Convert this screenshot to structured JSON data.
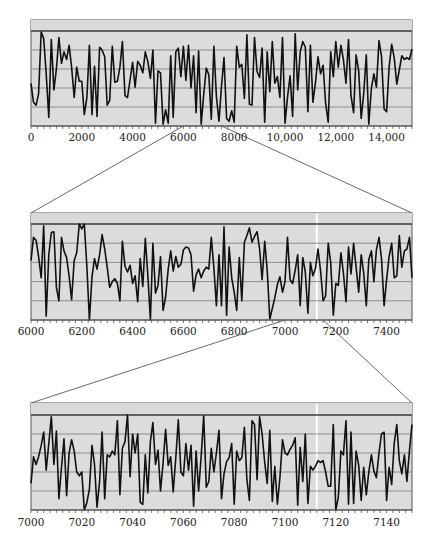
{
  "figure": {
    "colors": {
      "panel_fill": "#dcdcdc",
      "top_band_fill": "#d9d9d9",
      "frame": "#555555",
      "top_line": "#3a3a3a",
      "gridline": "#8c8c8c",
      "series": "#111111",
      "connector": "#444444",
      "highlight_stripe": "#ffffff",
      "tick_label": "#222222"
    }
  },
  "chart_data": [
    {
      "type": "line",
      "title": "",
      "xlabel": "",
      "ylabel": "",
      "xlim": [
        0,
        15000
      ],
      "ylim": [
        0,
        1
      ],
      "grid": "horizontal",
      "legend": "none",
      "tick_labels": [
        "0",
        "2000",
        "4000",
        "6000",
        "8000",
        "10,000",
        "12,000",
        "14,000"
      ],
      "tick_values": [
        0,
        2000,
        4000,
        6000,
        8000,
        10000,
        12000,
        14000
      ],
      "minor_tick_step": 250,
      "zoom_range": [
        6000,
        7500
      ],
      "x": [
        0,
        100,
        200,
        300,
        400,
        500,
        600,
        700,
        800,
        900,
        1000,
        1100,
        1200,
        1300,
        1400,
        1500,
        1600,
        1700,
        1800,
        1900,
        2000,
        2100,
        2200,
        2300,
        2400,
        2500,
        2600,
        2700,
        2800,
        2900,
        3000,
        3100,
        3200,
        3300,
        3400,
        3500,
        3600,
        3700,
        3800,
        3900,
        4000,
        4100,
        4200,
        4300,
        4400,
        4500,
        4600,
        4700,
        4800,
        4900,
        5000,
        5100,
        5200,
        5300,
        5400,
        5500,
        5600,
        5700,
        5800,
        5900,
        6000,
        6100,
        6200,
        6300,
        6400,
        6500,
        6600,
        6700,
        6800,
        6900,
        7000,
        7100,
        7200,
        7300,
        7400,
        7500,
        7600,
        7700,
        7800,
        7900,
        8000,
        8100,
        8200,
        8300,
        8400,
        8500,
        8600,
        8700,
        8800,
        8900,
        9000,
        9100,
        9200,
        9300,
        9400,
        9500,
        9600,
        9700,
        9800,
        9900,
        10000,
        10100,
        10200,
        10300,
        10400,
        10500,
        10600,
        10700,
        10800,
        10900,
        11000,
        11100,
        11200,
        11300,
        11400,
        11500,
        11600,
        11700,
        11800,
        11900,
        12000,
        12100,
        12200,
        12300,
        12400,
        12500,
        12600,
        12700,
        12800,
        12900,
        13000,
        13100,
        13200,
        13300,
        13400,
        13500,
        13600,
        13700,
        13800,
        13900,
        14000,
        14100,
        14200,
        14300,
        14400,
        14500,
        14600,
        14700,
        14800,
        14900,
        15000
      ],
      "values": [
        0.45,
        0.25,
        0.22,
        0.34,
        0.99,
        0.92,
        0.55,
        0.09,
        0.91,
        0.38,
        0.6,
        0.93,
        0.66,
        0.78,
        0.7,
        0.85,
        0.62,
        0.3,
        0.62,
        0.47,
        0.47,
        0.12,
        0.3,
        0.85,
        0.12,
        0.63,
        0.1,
        0.83,
        0.8,
        0.73,
        0.22,
        0.27,
        0.84,
        0.46,
        0.47,
        0.62,
        0.89,
        0.32,
        0.3,
        0.49,
        0.67,
        0.41,
        0.68,
        0.64,
        0.56,
        0.78,
        0.68,
        0.5,
        0.8,
        0.03,
        0.58,
        0.56,
        0.02,
        0.17,
        0.03,
        0.74,
        0.09,
        0.78,
        0.82,
        0.52,
        0.84,
        0.48,
        0.85,
        0.4,
        0.74,
        0.14,
        0.79,
        0.02,
        0.33,
        0.61,
        0.54,
        0.07,
        0.84,
        0.31,
        0.05,
        0.42,
        0.72,
        0.08,
        0.05,
        0.16,
        0.04,
        0.84,
        0.62,
        0.65,
        0.29,
        0.96,
        0.23,
        0.22,
        0.93,
        0.57,
        0.51,
        0.82,
        0.04,
        0.78,
        0.36,
        0.89,
        0.45,
        0.52,
        0.3,
        0.93,
        0.03,
        0.3,
        0.53,
        0.1,
        0.97,
        0.38,
        0.78,
        0.89,
        0.83,
        0.15,
        0.85,
        0.25,
        0.46,
        0.73,
        0.55,
        0.64,
        0.24,
        0.04,
        0.78,
        0.52,
        0.89,
        0.62,
        0.85,
        0.7,
        0.45,
        0.91,
        0.32,
        0.14,
        0.75,
        0.58,
        0.08,
        0.34,
        0.75,
        0.02,
        0.4,
        0.55,
        0.41,
        0.9,
        0.73,
        0.18,
        0.15,
        0.62,
        0.86,
        0.72,
        0.44,
        0.59,
        0.74,
        0.7,
        0.72,
        0.7,
        0.81
      ]
    },
    {
      "type": "line",
      "title": "",
      "xlabel": "",
      "ylabel": "",
      "xlim": [
        6000,
        7500
      ],
      "ylim": [
        0,
        1
      ],
      "grid": "horizontal",
      "legend": "none",
      "tick_labels": [
        "6000",
        "6200",
        "6400",
        "6600",
        "6800",
        "7000",
        "7200",
        "7400"
      ],
      "tick_values": [
        6000,
        6200,
        6400,
        6600,
        6800,
        7000,
        7200,
        7400
      ],
      "minor_tick_step": 25,
      "zoom_range": [
        7000,
        7150
      ],
      "highlight_x": 7125,
      "x": [
        6000,
        6010,
        6020,
        6030,
        6040,
        6050,
        6060,
        6070,
        6080,
        6090,
        6100,
        6110,
        6120,
        6130,
        6140,
        6150,
        6160,
        6170,
        6180,
        6190,
        6200,
        6210,
        6220,
        6230,
        6240,
        6250,
        6260,
        6270,
        6280,
        6290,
        6300,
        6310,
        6320,
        6330,
        6340,
        6350,
        6360,
        6370,
        6380,
        6390,
        6400,
        6410,
        6420,
        6430,
        6440,
        6450,
        6460,
        6470,
        6480,
        6490,
        6500,
        6510,
        6520,
        6530,
        6540,
        6550,
        6560,
        6570,
        6580,
        6590,
        6600,
        6610,
        6620,
        6630,
        6640,
        6650,
        6660,
        6670,
        6680,
        6690,
        6700,
        6710,
        6720,
        6730,
        6740,
        6750,
        6760,
        6770,
        6780,
        6790,
        6800,
        6810,
        6820,
        6830,
        6840,
        6850,
        6860,
        6870,
        6880,
        6890,
        6900,
        6910,
        6920,
        6930,
        6940,
        6950,
        6960,
        6970,
        6980,
        6990,
        7000,
        7010,
        7020,
        7030,
        7040,
        7050,
        7060,
        7070,
        7080,
        7090,
        7100,
        7110,
        7120,
        7130,
        7140,
        7150,
        7160,
        7170,
        7180,
        7190,
        7200,
        7210,
        7220,
        7230,
        7240,
        7250,
        7260,
        7270,
        7280,
        7290,
        7300,
        7310,
        7320,
        7330,
        7340,
        7350,
        7360,
        7370,
        7380,
        7390,
        7400,
        7410,
        7420,
        7430,
        7440,
        7450,
        7460,
        7470,
        7480,
        7490,
        7500
      ],
      "values": [
        0.62,
        0.86,
        0.83,
        0.66,
        0.44,
        0.98,
        0.04,
        0.68,
        0.91,
        0.92,
        0.34,
        0.2,
        0.86,
        0.72,
        0.65,
        0.46,
        0.21,
        0.62,
        0.7,
        1.0,
        0.95,
        1.0,
        0.55,
        0.0,
        0.45,
        0.64,
        0.53,
        0.68,
        0.89,
        0.74,
        0.55,
        0.34,
        0.4,
        0.43,
        0.38,
        0.2,
        0.82,
        0.56,
        0.5,
        0.57,
        0.38,
        0.46,
        0.19,
        0.64,
        0.35,
        0.85,
        0.47,
        0.0,
        0.8,
        0.28,
        0.36,
        0.66,
        0.1,
        0.24,
        0.53,
        0.72,
        0.51,
        0.66,
        0.55,
        0.58,
        0.73,
        0.76,
        0.75,
        0.68,
        0.3,
        0.47,
        0.53,
        0.44,
        0.51,
        0.55,
        0.53,
        0.86,
        0.54,
        0.15,
        0.68,
        0.15,
        0.97,
        0.05,
        0.76,
        0.44,
        0.29,
        0.1,
        0.65,
        0.2,
        0.81,
        0.88,
        0.96,
        0.81,
        0.87,
        0.92,
        0.74,
        0.42,
        0.82,
        0.52,
        0.01,
        0.12,
        0.23,
        0.37,
        0.45,
        0.29,
        0.4,
        0.86,
        0.42,
        0.38,
        0.52,
        0.68,
        0.15,
        0.65,
        0.5,
        0.07,
        0.6,
        0.46,
        0.54,
        0.74,
        0.51,
        0.2,
        0.25,
        0.8,
        0.6,
        0.05,
        0.38,
        0.36,
        0.7,
        0.49,
        0.19,
        0.76,
        0.48,
        0.8,
        0.55,
        0.29,
        0.68,
        0.49,
        0.15,
        0.63,
        0.72,
        0.4,
        0.73,
        0.86,
        0.64,
        0.15,
        0.42,
        0.66,
        0.8,
        0.44,
        0.46,
        0.88,
        0.55,
        0.72,
        0.74,
        0.86,
        0.44
      ]
    },
    {
      "type": "line",
      "title": "",
      "xlabel": "",
      "ylabel": "",
      "xlim": [
        7000,
        7150
      ],
      "ylim": [
        0,
        1
      ],
      "grid": "horizontal",
      "legend": "none",
      "tick_labels": [
        "7000",
        "7020",
        "7040",
        "7060",
        "7080",
        "7100",
        "7120",
        "7140"
      ],
      "tick_values": [
        7000,
        7020,
        7040,
        7060,
        7080,
        7100,
        7120,
        7140
      ],
      "minor_tick_step": 2.5,
      "highlight_x": 7112.5,
      "x": [
        7000,
        7001,
        7002,
        7003,
        7004,
        7005,
        7006,
        7007,
        7008,
        7009,
        7010,
        7011,
        7012,
        7013,
        7014,
        7015,
        7016,
        7017,
        7018,
        7019,
        7020,
        7021,
        7022,
        7023,
        7024,
        7025,
        7026,
        7027,
        7028,
        7029,
        7030,
        7031,
        7032,
        7033,
        7034,
        7035,
        7036,
        7037,
        7038,
        7039,
        7040,
        7041,
        7042,
        7043,
        7044,
        7045,
        7046,
        7047,
        7048,
        7049,
        7050,
        7051,
        7052,
        7053,
        7054,
        7055,
        7056,
        7057,
        7058,
        7059,
        7060,
        7061,
        7062,
        7063,
        7064,
        7065,
        7066,
        7067,
        7068,
        7069,
        7070,
        7071,
        7072,
        7073,
        7074,
        7075,
        7076,
        7077,
        7078,
        7079,
        7080,
        7081,
        7082,
        7083,
        7084,
        7085,
        7086,
        7087,
        7088,
        7089,
        7090,
        7091,
        7092,
        7093,
        7094,
        7095,
        7096,
        7097,
        7098,
        7099,
        7100,
        7101,
        7102,
        7103,
        7104,
        7105,
        7106,
        7107,
        7108,
        7109,
        7110,
        7111,
        7112,
        7113,
        7114,
        7115,
        7116,
        7117,
        7118,
        7119,
        7120,
        7121,
        7122,
        7123,
        7124,
        7125,
        7126,
        7127,
        7128,
        7129,
        7130,
        7131,
        7132,
        7133,
        7134,
        7135,
        7136,
        7137,
        7138,
        7139,
        7140,
        7141,
        7142,
        7143,
        7144,
        7145,
        7146,
        7147,
        7148,
        7149,
        7150
      ],
      "values": [
        0.28,
        0.56,
        0.48,
        0.56,
        0.68,
        0.82,
        0.42,
        0.7,
        0.98,
        0.48,
        0.83,
        0.12,
        0.45,
        0.75,
        0.15,
        0.6,
        0.74,
        0.62,
        0.4,
        0.36,
        0.4,
        0.0,
        0.08,
        0.22,
        0.68,
        0.48,
        0.03,
        0.3,
        0.82,
        0.12,
        0.58,
        0.56,
        0.62,
        0.58,
        0.94,
        0.16,
        0.65,
        0.72,
        1.0,
        0.35,
        0.8,
        0.6,
        0.8,
        0.08,
        0.06,
        0.58,
        0.18,
        0.72,
        0.92,
        0.48,
        0.63,
        0.2,
        0.5,
        0.85,
        0.47,
        0.56,
        0.19,
        0.55,
        0.95,
        0.4,
        0.36,
        0.7,
        0.42,
        0.68,
        0.04,
        0.62,
        0.2,
        0.57,
        0.99,
        0.24,
        0.3,
        0.65,
        0.4,
        0.6,
        0.84,
        0.12,
        0.38,
        0.51,
        0.55,
        0.7,
        0.06,
        0.62,
        0.52,
        0.55,
        0.87,
        0.32,
        0.1,
        0.94,
        0.9,
        0.32,
        0.98,
        0.8,
        0.5,
        0.28,
        0.84,
        0.09,
        0.46,
        0.06,
        0.34,
        0.74,
        0.6,
        0.58,
        0.64,
        0.68,
        0.76,
        0.05,
        0.66,
        0.3,
        0.8,
        0.07,
        0.46,
        0.42,
        0.46,
        0.52,
        0.5,
        0.52,
        0.4,
        0.25,
        0.25,
        0.9,
        0.0,
        0.13,
        0.62,
        0.58,
        0.94,
        0.06,
        0.82,
        0.07,
        0.62,
        0.47,
        0.1,
        0.45,
        0.16,
        0.4,
        0.58,
        0.41,
        0.34,
        0.6,
        0.8,
        0.82,
        0.1,
        0.45,
        0.27,
        0.7,
        0.9,
        0.52,
        0.38,
        0.58,
        0.3,
        0.63,
        0.9
      ]
    }
  ]
}
